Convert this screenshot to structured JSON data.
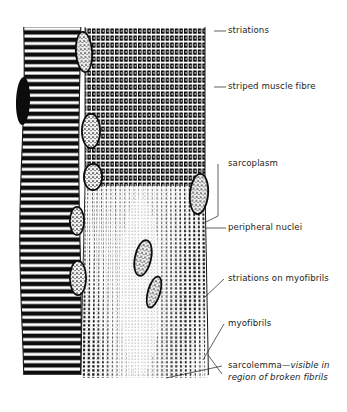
{
  "figure": {
    "background_color": "#ffffff",
    "ink_color": "#111111",
    "labels": [
      {
        "id": "striations",
        "text": "striations",
        "x": 228,
        "y": 25,
        "leader": [
          [
            214,
            31
          ],
          [
            226,
            31
          ]
        ],
        "italic": false
      },
      {
        "id": "striped-muscle-fibre",
        "text": "striped muscle fibre",
        "x": 228,
        "y": 81,
        "leader": [
          [
            214,
            87
          ],
          [
            226,
            87
          ]
        ],
        "italic": false
      },
      {
        "id": "sarcoplasm",
        "text": "sarcoplasm",
        "x": 228,
        "y": 158,
        "leader": [
          [
            218,
            164
          ],
          [
            218,
            216
          ],
          [
            206,
            222
          ]
        ],
        "italic": false
      },
      {
        "id": "peripheral-nuclei",
        "text": "peripheral nuclei",
        "x": 228,
        "y": 222,
        "leader": [
          [
            206,
            228
          ],
          [
            226,
            228
          ]
        ],
        "italic": false
      },
      {
        "id": "striations-on-myofibrils",
        "text": "striations on myofibrils",
        "x": 228,
        "y": 273,
        "leader": [
          [
            205,
            297
          ],
          [
            224,
            279
          ]
        ],
        "italic": false
      },
      {
        "id": "myofibrils",
        "text": "myofibrils",
        "x": 228,
        "y": 318,
        "leader": [
          [
            203,
            360
          ],
          [
            224,
            324
          ]
        ],
        "italic": false
      },
      {
        "id": "sarcolemma",
        "text_roman": "sarcolemma",
        "text_italic": "—visible in region of broken fibrils",
        "x": 228,
        "y": 360,
        "leader": [
          [
            166,
            378
          ],
          [
            222,
            366
          ]
        ],
        "leader2": [
          [
            208,
            355
          ],
          [
            222,
            374
          ]
        ],
        "italic": true
      }
    ],
    "left_fibre": {
      "name": "left striped muscle fibre",
      "x": 22,
      "y": 27,
      "width": 58,
      "height": 351,
      "stripe_period": 7.4,
      "stripe_dark": 4.2
    },
    "right_fibre": {
      "name": "right striped muscle fibre with myofibrils",
      "x": 85,
      "y": 27,
      "width": 120,
      "height": 351,
      "solid_zone_end": 186,
      "myofibril_count": 26,
      "striation_period": 7.0
    },
    "nuclei": [
      {
        "cx": 84,
        "cy": 52,
        "rx": 9,
        "ry": 21,
        "rot": -4
      },
      {
        "cx": 23,
        "cy": 101,
        "rx": 7,
        "ry": 24,
        "rot": 2
      },
      {
        "cx": 91,
        "cy": 131,
        "rx": 10,
        "ry": 18,
        "rot": 0
      },
      {
        "cx": 93,
        "cy": 177,
        "rx": 10,
        "ry": 14,
        "rot": 0
      },
      {
        "cx": 199,
        "cy": 194,
        "rx": 10,
        "ry": 21,
        "rot": 5
      },
      {
        "cx": 77,
        "cy": 221,
        "rx": 8,
        "ry": 15,
        "rot": 0
      },
      {
        "cx": 78,
        "cy": 278,
        "rx": 9,
        "ry": 18,
        "rot": 0
      },
      {
        "cx": 143,
        "cy": 258,
        "rx": 9,
        "ry": 19,
        "rot": 12
      },
      {
        "cx": 154,
        "cy": 292,
        "rx": 7,
        "ry": 17,
        "rot": 16
      }
    ]
  }
}
